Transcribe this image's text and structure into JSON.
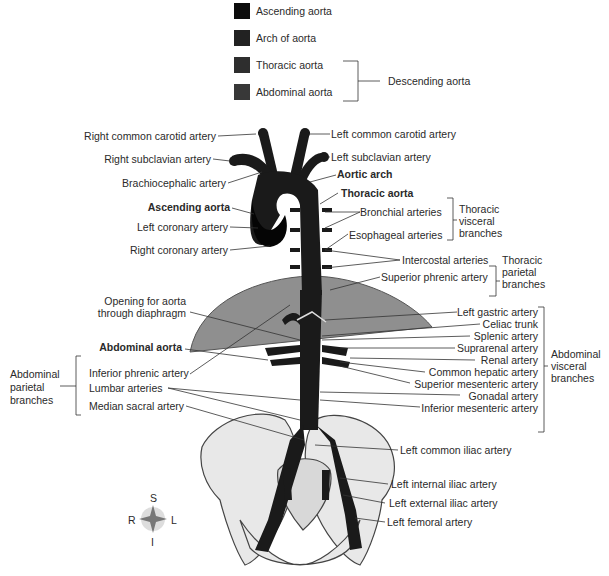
{
  "legend": {
    "items": [
      {
        "label": "Ascending aorta",
        "color": "#0c0c0c"
      },
      {
        "label": "Arch of aorta",
        "color": "#222222"
      },
      {
        "label": "Thoracic aorta",
        "color": "#2e2e2e"
      },
      {
        "label": "Abdominal aorta",
        "color": "#383838"
      }
    ],
    "group_label": "Descending aorta"
  },
  "labels_left": {
    "right_common_carotid": "Right common carotid artery",
    "right_subclavian": "Right subclavian artery",
    "brachiocephalic": "Brachiocephalic artery",
    "ascending_aorta": "Ascending aorta",
    "left_coronary": "Left coronary artery",
    "right_coronary": "Right coronary artery",
    "opening_line1": "Opening for aorta",
    "opening_line2": "through diaphragm",
    "abdominal_aorta": "Abdominal aorta",
    "inferior_phrenic": "Inferior phrenic artery",
    "lumbar": "Lumbar arteries",
    "median_sacral": "Median sacral artery",
    "group_abd_parietal": [
      "Abdominal",
      "parietal",
      "branches"
    ]
  },
  "labels_right": {
    "left_common_carotid": "Left common carotid artery",
    "left_subclavian": "Left subclavian artery",
    "aortic_arch": "Aortic arch",
    "thoracic_aorta": "Thoracic aorta",
    "bronchial": "Bronchial arteries",
    "esophageal": "Esophageal arteries",
    "group_thoracic_visceral": [
      "Thoracic",
      "visceral",
      "branches"
    ],
    "intercostal": "Intercostal arteries",
    "superior_phrenic": "Superior phrenic artery",
    "group_thoracic_parietal": [
      "Thoracic",
      "parietal",
      "branches"
    ],
    "left_gastric": "Left gastric artery",
    "celiac_trunk": "Celiac trunk",
    "splenic": "Splenic artery",
    "suprarenal": "Suprarenal artery",
    "renal": "Renal artery",
    "common_hepatic": "Common hepatic artery",
    "superior_mesenteric": "Superior mesenteric artery",
    "gonadal": "Gonadal artery",
    "inferior_mesenteric": "Inferior mesenteric artery",
    "group_abd_visceral": [
      "Abdominal",
      "visceral",
      "branches"
    ],
    "left_common_iliac": "Left common iliac artery",
    "left_internal_iliac": "Left internal iliac artery",
    "left_external_iliac": "Left external iliac artery",
    "left_femoral": "Left femoral artery"
  },
  "compass": {
    "S": "S",
    "I": "I",
    "R": "R",
    "L": "L"
  },
  "colors": {
    "aorta": "#1a1a1a",
    "diaphragm": "#8f8f8f",
    "bone": "#e6e6e6",
    "line": "#333333"
  }
}
